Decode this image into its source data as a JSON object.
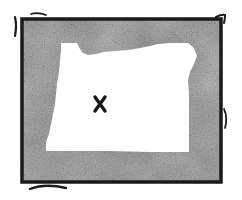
{
  "illustration": {
    "subject": "Oregon state outline",
    "marker": "x-mark",
    "marker_position": [
      100,
      104
    ],
    "colors": {
      "background": "#ffffff",
      "frame_border": "#1a1a1a",
      "texture_fill": "#9a9a9a",
      "texture_dark": "#6e6e6e",
      "texture_light": "#cfcfcf",
      "state_fill": "#ffffff",
      "marker": "#1a1a1a"
    }
  }
}
